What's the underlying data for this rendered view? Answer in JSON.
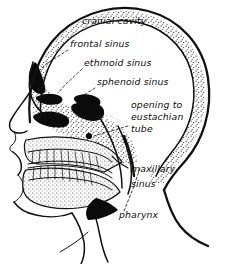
{
  "figure": {
    "style": "black-and-white line drawing with stippled bone shading",
    "background_color": "#ffffff",
    "ink_color": "#111111",
    "width": 226,
    "height": 264
  },
  "labels": [
    {
      "id": "cranial-cavity",
      "text": "cranial cavity",
      "lines": [
        "cranial cavity"
      ],
      "x": 82,
      "y": 24,
      "has_leader": false
    },
    {
      "id": "frontal-sinus",
      "text": "frontal sinus",
      "lines": [
        "frontal sinus"
      ],
      "x": 70,
      "y": 47,
      "has_leader": true
    },
    {
      "id": "ethmoid-sinus",
      "text": "ethmoid sinus",
      "lines": [
        "ethmoid sinus"
      ],
      "x": 84,
      "y": 66,
      "has_leader": true
    },
    {
      "id": "sphenoid-sinus",
      "text": "sphenoid sinus",
      "lines": [
        "sphenoid sinus"
      ],
      "x": 97,
      "y": 85,
      "has_leader": true
    },
    {
      "id": "opening-to-eustachian-tube",
      "text": "opening to eustachian tube",
      "lines": [
        "opening to",
        "eustachian",
        "tube"
      ],
      "x": 131,
      "y": 108,
      "has_leader": true
    },
    {
      "id": "maxillary-sinus",
      "text": "maxillary sinus",
      "lines": [
        "maxillary",
        "sinus"
      ],
      "x": 131,
      "y": 172,
      "has_leader": true
    },
    {
      "id": "pharynx",
      "text": "pharynx",
      "lines": [
        "pharynx"
      ],
      "x": 119,
      "y": 218,
      "has_leader": true
    }
  ],
  "structures": [
    {
      "id": "cranial-vault",
      "name": "cranial vault (stippled bone)"
    },
    {
      "id": "frontal-sinus-cavity",
      "name": "frontal sinus cavity (black)"
    },
    {
      "id": "ethmoid-sinus-cavity",
      "name": "ethmoid sinus cavity (black)"
    },
    {
      "id": "sphenoid-sinus-cavity",
      "name": "sphenoid sinus cavity (black)"
    },
    {
      "id": "nasal-turbinates",
      "name": "nasal turbinates (black)"
    },
    {
      "id": "maxilla-teeth",
      "name": "upper teeth row"
    },
    {
      "id": "mandible-teeth",
      "name": "lower teeth row"
    },
    {
      "id": "eustachian-opening-dot",
      "name": "eustachian tube opening marker"
    },
    {
      "id": "neck-outline",
      "name": "neck and shoulder contour"
    }
  ]
}
